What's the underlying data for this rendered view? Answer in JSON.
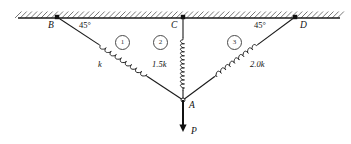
{
  "figure": {
    "type": "statics-diagram",
    "colors": {
      "line": "#1a1a1a",
      "hatch": "#555555",
      "circle_stroke": "#4a4a4a",
      "text": "#111111",
      "background": "#ffffff"
    },
    "support": {
      "name": "ceiling-hatched-support",
      "x1": 18,
      "x2": 340,
      "y": 18,
      "hatch_count": 62
    },
    "nodes": [
      {
        "id": "B",
        "label": "B",
        "x": 57,
        "y": 17,
        "label_x": 48,
        "label_y": 21,
        "fixed": true
      },
      {
        "id": "C",
        "label": "C",
        "x": 183,
        "y": 17,
        "label_x": 171,
        "label_y": 21,
        "fixed": true
      },
      {
        "id": "D",
        "label": "D",
        "x": 295,
        "y": 17,
        "label_x": 300,
        "label_y": 21,
        "fixed": true
      },
      {
        "id": "A",
        "label": "A",
        "x": 183,
        "y": 100,
        "label_x": 189,
        "label_y": 101,
        "fixed": false
      }
    ],
    "angles": [
      {
        "id": "angle-left",
        "text": "45°",
        "x": 79,
        "y": 21
      },
      {
        "id": "angle-right",
        "text": "45°",
        "x": 254,
        "y": 21
      }
    ],
    "members": [
      {
        "id": "member-1",
        "number": "1",
        "stiffness": "k",
        "from": "B",
        "to": "A",
        "number_x": 115,
        "number_y": 35,
        "stiffness_x": 98,
        "stiffness_y": 60,
        "spring_coils": 9
      },
      {
        "id": "member-2",
        "number": "2",
        "stiffness": "1.5k",
        "from": "C",
        "to": "A",
        "number_x": 153,
        "number_y": 35,
        "stiffness_x": 152,
        "stiffness_y": 60,
        "spring_coils": 12
      },
      {
        "id": "member-3",
        "number": "3",
        "stiffness": "2.0k",
        "from": "D",
        "to": "A",
        "number_x": 227,
        "number_y": 35,
        "stiffness_x": 250,
        "stiffness_y": 60,
        "spring_coils": 9
      }
    ],
    "load": {
      "id": "applied-load",
      "label": "P",
      "from_x": 183,
      "from_y": 100,
      "to_x": 183,
      "to_y": 132,
      "label_x": 191,
      "label_y": 127
    }
  }
}
